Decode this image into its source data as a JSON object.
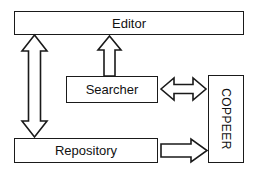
{
  "diagram": {
    "background_color": "#ffffff",
    "stroke_color": "#1a1a1a",
    "fill_color": "#ffffff",
    "nodes": [
      {
        "id": "editor",
        "label": "Editor"
      },
      {
        "id": "searcher",
        "label": "Searcher"
      },
      {
        "id": "repository",
        "label": "Repository"
      },
      {
        "id": "coppeer",
        "label": "COPPEER",
        "orientation": "vertical-rotated-90"
      }
    ],
    "connectors": [
      {
        "id": "editor-repository",
        "from": "Editor",
        "to": "Repository",
        "style": "hollow-block-arrow",
        "direction": "bidirectional-vertical"
      },
      {
        "id": "searcher-editor",
        "from": "Searcher",
        "to": "Editor",
        "style": "hollow-block-arrow",
        "direction": "up"
      },
      {
        "id": "searcher-coppeer",
        "from": "Searcher",
        "to": "COPPEER",
        "style": "hollow-block-arrow",
        "direction": "bidirectional-horizontal"
      },
      {
        "id": "repository-coppeer",
        "from": "Repository",
        "to": "COPPEER",
        "style": "hollow-block-arrow",
        "direction": "right"
      }
    ]
  }
}
